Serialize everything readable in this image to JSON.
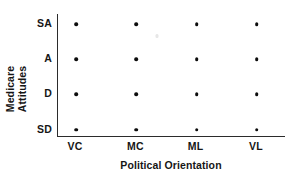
{
  "chart_data": {
    "type": "scatter",
    "title": "",
    "xlabel": "Political Orientation",
    "ylabel_lines": [
      "Medicare",
      "Attitudes"
    ],
    "ylabel": "Medicare Attitudes",
    "categories": [
      "VC",
      "MC",
      "ML",
      "VL"
    ],
    "ycategories": [
      "SA",
      "A",
      "D",
      "SD"
    ],
    "ycategories_top_to_bottom": [
      "SA",
      "A",
      "D",
      "SD"
    ],
    "xtick_labels": [
      "VC",
      "MC",
      "ML",
      "VL"
    ],
    "ytick_labels": [
      "SA",
      "A",
      "D",
      "SD"
    ],
    "grid": false,
    "legend": false,
    "marker": "filled-circle",
    "marker_color": "#0d0d0d",
    "axis_color": "#2b2b2b",
    "background_color": "#ffffff",
    "spines": [
      "left",
      "bottom"
    ],
    "n_points": 16,
    "points": [
      {
        "x": "VC",
        "y": "SA"
      },
      {
        "x": "MC",
        "y": "SA"
      },
      {
        "x": "ML",
        "y": "SA"
      },
      {
        "x": "VL",
        "y": "SA"
      },
      {
        "x": "VC",
        "y": "A"
      },
      {
        "x": "MC",
        "y": "A"
      },
      {
        "x": "ML",
        "y": "A"
      },
      {
        "x": "VL",
        "y": "A"
      },
      {
        "x": "VC",
        "y": "D"
      },
      {
        "x": "MC",
        "y": "D"
      },
      {
        "x": "ML",
        "y": "D"
      },
      {
        "x": "VL",
        "y": "D"
      },
      {
        "x": "VC",
        "y": "SD"
      },
      {
        "x": "MC",
        "y": "SD"
      },
      {
        "x": "ML",
        "y": "SD"
      },
      {
        "x": "VL",
        "y": "SD"
      }
    ]
  }
}
